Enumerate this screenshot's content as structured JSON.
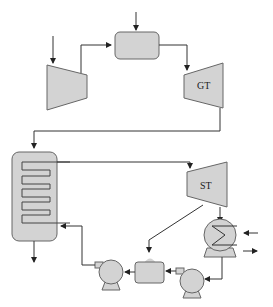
{
  "diagram": {
    "type": "combined-cycle power plant schematic",
    "colors": {
      "fill": "#d3d3d3",
      "stroke": "#555555",
      "line": "#333333",
      "background": "#ffffff"
    },
    "components": {
      "compressor": {
        "label": ""
      },
      "combustor": {
        "label": ""
      },
      "gas_turbine": {
        "label": "GT"
      },
      "hrsg": {
        "label": ""
      },
      "steam_turbine": {
        "label": "ST"
      },
      "condenser": {
        "label": ""
      },
      "condensate_pump": {
        "label": ""
      },
      "deaerator": {
        "label": ""
      },
      "feed_pump": {
        "label": ""
      }
    }
  }
}
